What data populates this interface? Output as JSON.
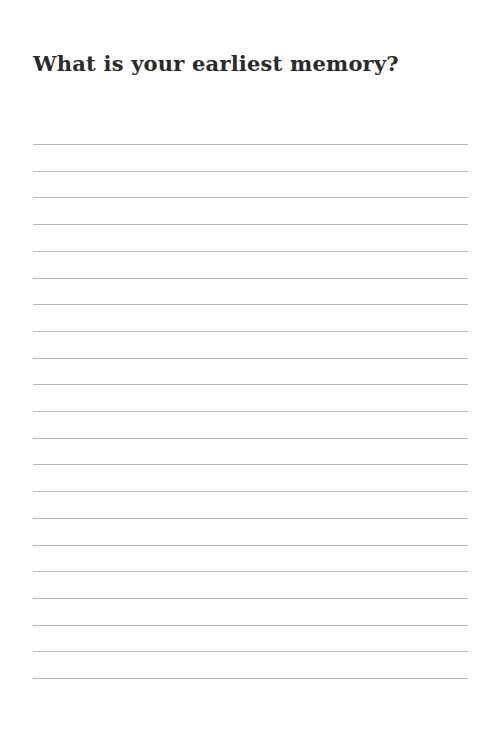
{
  "page": {
    "title": "What is your earliest memory?",
    "line_count": 21,
    "line_color": "#bdbdbd",
    "text_color": "#2a2a2a",
    "background": "#ffffff"
  }
}
